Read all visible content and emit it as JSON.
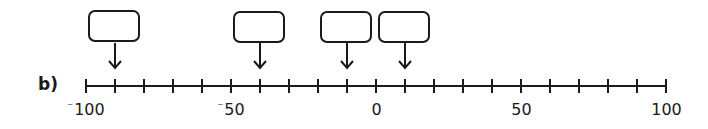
{
  "question": {
    "part_label": "b)"
  },
  "number_line": {
    "min": -100,
    "max": 100,
    "step": 10,
    "labels": [
      {
        "value": -100,
        "sign": "⁻",
        "digits": "100"
      },
      {
        "value": -50,
        "sign": "⁻",
        "digits": "50"
      },
      {
        "value": 0,
        "sign": "",
        "digits": "0"
      },
      {
        "value": 50,
        "sign": "",
        "digits": "50"
      },
      {
        "value": 100,
        "sign": "",
        "digits": "100"
      }
    ],
    "colors": {
      "line": "#1a1a1a",
      "box_border": "#1a1a1a"
    }
  },
  "answer_boxes": [
    {
      "points_to": -90,
      "value": ""
    },
    {
      "points_to": -40,
      "value": ""
    },
    {
      "points_to": -10,
      "value": ""
    },
    {
      "points_to": 10,
      "value": ""
    }
  ]
}
